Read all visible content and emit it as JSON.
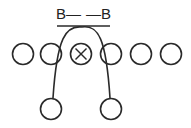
{
  "diagram": {
    "type": "football-play",
    "stroke_color": "#2a2a2a",
    "background": "#ffffff",
    "top_label": {
      "left": "B—",
      "right": "—B"
    },
    "line_of_scrimmage": {
      "x1": 57,
      "x2": 110,
      "y": 26
    },
    "front_row": [
      {
        "id": "player-1",
        "cx": 23,
        "cy": 54,
        "r": 10.5,
        "marked": false
      },
      {
        "id": "player-2",
        "cx": 51,
        "cy": 54,
        "r": 10.5,
        "marked": false
      },
      {
        "id": "player-3",
        "cx": 81,
        "cy": 54,
        "r": 10.5,
        "marked": true,
        "mark": "X"
      },
      {
        "id": "player-4",
        "cx": 111,
        "cy": 54,
        "r": 10.5,
        "marked": false
      },
      {
        "id": "player-5",
        "cx": 141,
        "cy": 54,
        "r": 10.5,
        "marked": false
      },
      {
        "id": "player-6",
        "cx": 171,
        "cy": 54,
        "r": 10.5,
        "marked": false
      }
    ],
    "back_row": [
      {
        "id": "back-1",
        "cx": 51,
        "cy": 109,
        "r": 10.5
      },
      {
        "id": "back-2",
        "cx": 111,
        "cy": 109,
        "r": 10.5
      }
    ],
    "route_arch": {
      "start": [
        53,
        98
      ],
      "peak": [
        82,
        27
      ],
      "end": [
        110,
        98
      ]
    }
  }
}
